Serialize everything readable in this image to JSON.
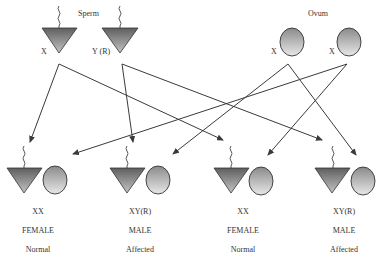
{
  "diagram": {
    "type": "inheritance-cross",
    "colors": {
      "line": "#3a3a3a",
      "sperm_fill_dark": "#5e5e5e",
      "sperm_fill_light": "#c4c4c4",
      "ovum_fill_dark": "#8a8a8a",
      "ovum_fill_light": "#e8e8e8",
      "text": "#333333"
    },
    "parents": {
      "sperm": {
        "heading": "Sperm",
        "gametes": [
          {
            "label": "X"
          },
          {
            "label": "Y (R)"
          }
        ]
      },
      "ovum": {
        "heading": "Ovum",
        "gametes": [
          {
            "label": "X"
          },
          {
            "label": "X"
          }
        ]
      }
    },
    "offspring": [
      {
        "genotype": "XX",
        "sex": "FEMALE",
        "status": "Normal"
      },
      {
        "genotype": "XY(R)",
        "sex": "MALE",
        "status": "Affected"
      },
      {
        "genotype": "XX",
        "sex": "FEMALE",
        "status": "Normal"
      },
      {
        "genotype": "XY(R)",
        "sex": "MALE",
        "status": "Affected"
      }
    ],
    "connections": [
      {
        "from": "sperm-X",
        "to": "offspring-1"
      },
      {
        "from": "sperm-X",
        "to": "offspring-3"
      },
      {
        "from": "sperm-Y(R)",
        "to": "offspring-2"
      },
      {
        "from": "sperm-Y(R)",
        "to": "offspring-4"
      },
      {
        "from": "ovum-1",
        "to": "offspring-2"
      },
      {
        "from": "ovum-1",
        "to": "offspring-4"
      },
      {
        "from": "ovum-2",
        "to": "offspring-1"
      },
      {
        "from": "ovum-2",
        "to": "offspring-3"
      }
    ]
  }
}
